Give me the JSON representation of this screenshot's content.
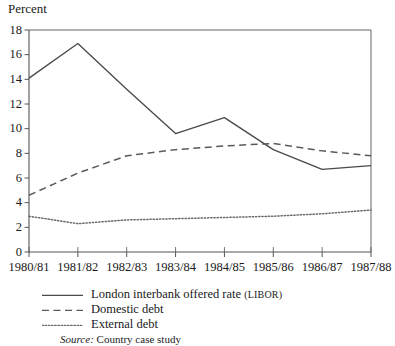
{
  "figure": {
    "axis_title": "Percent",
    "source_prefix": "Source:",
    "source_text": "Country case study"
  },
  "legend": {
    "entries": [
      {
        "label_main": "London interbank offered rate ",
        "label_paren": "(LIBOR)",
        "style": "solid",
        "name": "legend-libor"
      },
      {
        "label_main": "Domestic debt",
        "label_paren": "",
        "style": "dashed",
        "name": "legend-domestic-debt"
      },
      {
        "label_main": "External debt",
        "label_paren": "",
        "style": "dotted",
        "name": "legend-external-debt"
      }
    ]
  },
  "chart_data": {
    "type": "line",
    "title": "",
    "subtitle": "",
    "xlabel": "",
    "ylabel": "Percent",
    "categories": [
      "1980/81",
      "1981/82",
      "1982/83",
      "1983/84",
      "1984/85",
      "1985/86",
      "1986/87",
      "1987/88"
    ],
    "x": [
      0,
      1,
      2,
      3,
      4,
      5,
      6,
      7
    ],
    "ylim": [
      0,
      18
    ],
    "ytick_values": [
      0,
      2,
      4,
      6,
      8,
      10,
      12,
      14,
      16,
      18
    ],
    "ytick_labels": [
      "0",
      "2",
      "4",
      "6",
      "8",
      "10",
      "12",
      "14",
      "16",
      "18"
    ],
    "grid": false,
    "legend_position": "below-left",
    "series": [
      {
        "name": "London interbank offered rate (LIBOR)",
        "style": "solid",
        "color": "#4a4a4a",
        "values": [
          14.1,
          16.9,
          13.2,
          9.6,
          10.9,
          8.3,
          6.7,
          7.0
        ]
      },
      {
        "name": "Domestic debt",
        "style": "dashed",
        "color": "#5a5a5a",
        "values": [
          4.6,
          6.4,
          7.8,
          8.3,
          8.6,
          8.8,
          8.2,
          7.8
        ]
      },
      {
        "name": "External debt",
        "style": "dotted",
        "color": "#6a6a6a",
        "values": [
          2.9,
          2.3,
          2.6,
          2.7,
          2.8,
          2.9,
          3.1,
          3.4
        ]
      }
    ],
    "axis_color": "#555555",
    "plot_box": {
      "left": 29,
      "right": 371,
      "top": 30,
      "bottom": 252
    }
  }
}
